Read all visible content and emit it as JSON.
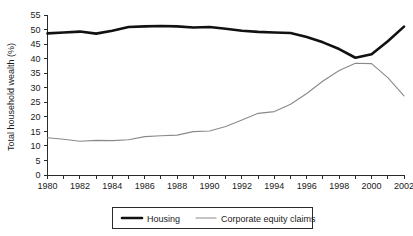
{
  "chart_data": {
    "type": "line",
    "title": "",
    "subtitle": "",
    "xlabel": "",
    "ylabel": "Total household wealth (%)",
    "xlim": [
      1980,
      2002
    ],
    "ylim": [
      0,
      55
    ],
    "grid": false,
    "legend_position": "bottom-center",
    "x": [
      1980,
      1981,
      1982,
      1983,
      1984,
      1985,
      1986,
      1987,
      1988,
      1989,
      1990,
      1991,
      1992,
      1993,
      1994,
      1995,
      1996,
      1997,
      1998,
      1999,
      2000,
      2001,
      2002
    ],
    "xtick_labels": [
      "1980",
      "1982",
      "1984",
      "1986",
      "1988",
      "1990",
      "1992",
      "1994",
      "1996",
      "1998",
      "2000",
      "2002"
    ],
    "xtick_values": [
      1980,
      1982,
      1984,
      1986,
      1988,
      1990,
      1992,
      1994,
      1996,
      1998,
      2000,
      2002
    ],
    "xtick_minor_values": [
      1981,
      1983,
      1985,
      1987,
      1989,
      1991,
      1993,
      1995,
      1997,
      1999,
      2001
    ],
    "ytick_labels": [
      "0",
      "5",
      "10",
      "15",
      "20",
      "25",
      "30",
      "35",
      "40",
      "45",
      "50",
      "55"
    ],
    "ytick_values": [
      0,
      5,
      10,
      15,
      20,
      25,
      30,
      35,
      40,
      45,
      50,
      55
    ],
    "series": [
      {
        "name": "Housing",
        "color": "#111111",
        "line_width": 2.6,
        "values": [
          48.7,
          49.0,
          49.3,
          48.6,
          49.6,
          50.9,
          51.1,
          51.2,
          51.1,
          50.7,
          50.9,
          50.3,
          49.6,
          49.2,
          49.0,
          48.8,
          47.4,
          45.6,
          43.3,
          40.3,
          41.5,
          46.0,
          51.0
        ]
      },
      {
        "name": "Corporate equity claims",
        "color": "#8a8a8a",
        "line_width": 1.1,
        "values": [
          12.8,
          12.3,
          11.6,
          11.9,
          11.8,
          12.1,
          13.2,
          13.5,
          13.7,
          14.9,
          15.1,
          16.7,
          18.9,
          21.2,
          21.8,
          24.3,
          28.0,
          32.3,
          35.9,
          38.4,
          38.3,
          33.5,
          27.2
        ]
      }
    ]
  },
  "legend": {
    "items": [
      {
        "label": "Housing"
      },
      {
        "label": "Corporate equity claims"
      }
    ]
  },
  "colors": {
    "housing": "#111111",
    "equity": "#8a8a8a",
    "axis": "#2b2b2b",
    "background": "#ffffff"
  }
}
